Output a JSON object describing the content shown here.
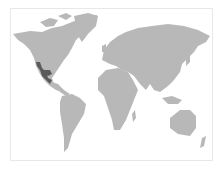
{
  "map": {
    "type": "world-map",
    "projection": "equirectangular-like",
    "land_color": "#b8b8b8",
    "highlight_color": "#5a5a5a",
    "background_color": "#ffffff",
    "highlighted_regions": [
      {
        "name": "Western Mexico / Southwestern United States",
        "shade": "dark"
      }
    ]
  }
}
